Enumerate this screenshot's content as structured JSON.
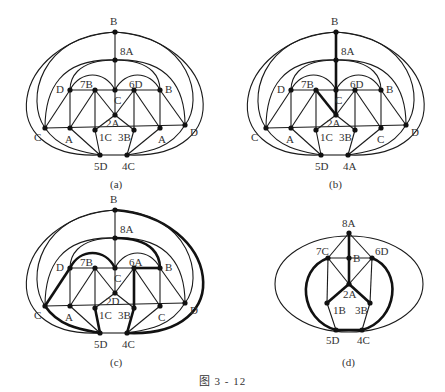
{
  "figure": {
    "caption": "图   3 - 12",
    "panels": [
      {
        "id": "a",
        "label": "(a)",
        "nodes": [
          {
            "id": "B",
            "label": "B"
          },
          {
            "id": "8A",
            "label": "8A"
          },
          {
            "id": "C",
            "label": "C"
          },
          {
            "id": "D",
            "label": "D"
          },
          {
            "id": "7B",
            "label": "7B"
          },
          {
            "id": "6D",
            "label": "6D"
          },
          {
            "id": "B2",
            "label": "B"
          },
          {
            "id": "2A",
            "label": "2A"
          },
          {
            "id": "Cl",
            "label": "C"
          },
          {
            "id": "Al",
            "label": "A"
          },
          {
            "id": "1C",
            "label": "1C"
          },
          {
            "id": "3B",
            "label": "3B"
          },
          {
            "id": "Ar",
            "label": "A"
          },
          {
            "id": "Dr",
            "label": "D"
          },
          {
            "id": "5D",
            "label": "5D"
          },
          {
            "id": "4C",
            "label": "4C"
          }
        ]
      },
      {
        "id": "b",
        "label": "(b)",
        "nodes": [
          {
            "id": "B",
            "label": "B"
          },
          {
            "id": "8A",
            "label": "8A"
          },
          {
            "id": "C",
            "label": "C"
          },
          {
            "id": "D",
            "label": "D"
          },
          {
            "id": "7B",
            "label": "7B"
          },
          {
            "id": "6D",
            "label": "6D"
          },
          {
            "id": "B2",
            "label": "B"
          },
          {
            "id": "2A",
            "label": "2A"
          },
          {
            "id": "Cl",
            "label": "C"
          },
          {
            "id": "A",
            "label": "A"
          },
          {
            "id": "1C",
            "label": "1C"
          },
          {
            "id": "3B",
            "label": "3B"
          },
          {
            "id": "Cr",
            "label": "C"
          },
          {
            "id": "Dr",
            "label": "D"
          },
          {
            "id": "5D",
            "label": "5D"
          },
          {
            "id": "4A",
            "label": "4A"
          }
        ]
      },
      {
        "id": "c",
        "label": "(c)",
        "nodes": [
          {
            "id": "B",
            "label": "B"
          },
          {
            "id": "8A",
            "label": "8A"
          },
          {
            "id": "C",
            "label": "C"
          },
          {
            "id": "D",
            "label": "D"
          },
          {
            "id": "7B",
            "label": "7B"
          },
          {
            "id": "6A",
            "label": "6A"
          },
          {
            "id": "B2",
            "label": "B"
          },
          {
            "id": "2D",
            "label": "2D"
          },
          {
            "id": "Cl",
            "label": "C"
          },
          {
            "id": "A",
            "label": "A"
          },
          {
            "id": "1C",
            "label": "1C"
          },
          {
            "id": "3B",
            "label": "3B"
          },
          {
            "id": "Cr",
            "label": "C"
          },
          {
            "id": "Dr",
            "label": "D"
          },
          {
            "id": "5D",
            "label": "5D"
          },
          {
            "id": "4C",
            "label": "4C"
          }
        ]
      },
      {
        "id": "d",
        "label": "(d)",
        "nodes": [
          {
            "id": "8A",
            "label": "8A"
          },
          {
            "id": "7C",
            "label": "7C"
          },
          {
            "id": "B",
            "label": "B"
          },
          {
            "id": "6D",
            "label": "6D"
          },
          {
            "id": "2A",
            "label": "2A"
          },
          {
            "id": "1B",
            "label": "1B"
          },
          {
            "id": "3B",
            "label": "3B"
          },
          {
            "id": "5D",
            "label": "5D"
          },
          {
            "id": "4C",
            "label": "4C"
          }
        ]
      }
    ]
  }
}
